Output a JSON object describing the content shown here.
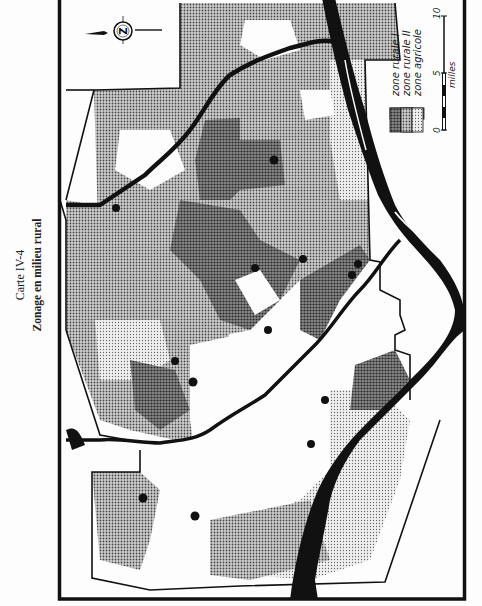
{
  "map": {
    "caption": "Carte IV-4",
    "title": "Zonage en milieu rural",
    "orientation": "rotated 90° counter-clockwise",
    "north_arrow": {
      "letter": "Z",
      "icon": "compass-rose-icon"
    },
    "legend": {
      "items": [
        {
          "label": "zone rurale I",
          "pattern": "dense-dark-dots"
        },
        {
          "label": "zone rurale II",
          "pattern": "medium-dots"
        },
        {
          "label": "zone agricole",
          "pattern": "light-dots"
        }
      ]
    },
    "scale": {
      "ticks": [
        "0",
        "5",
        "10"
      ],
      "unit": "milles"
    },
    "colors": {
      "ink": "#111111",
      "paper": "#fdfdfd",
      "zone_rurale_1": "#6e6e6e",
      "zone_rurale_2": "#9a9a9a",
      "zone_agricole": "#c8c8c8"
    },
    "settlements_count": 17
  }
}
